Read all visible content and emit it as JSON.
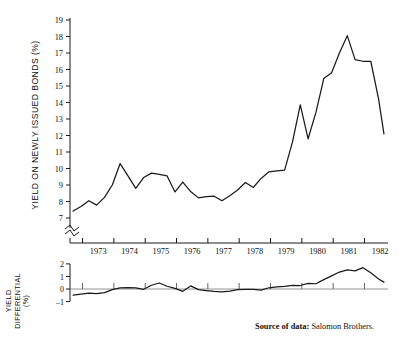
{
  "figure": {
    "source_label": "Source of data:",
    "source_value": "Salomon Brothers.",
    "background": "#ffffff",
    "line_color": "#1a1a1a",
    "axis_color": "#1a1a1a"
  },
  "main_axis": {
    "ylabel": "YIELD ON NEWLY ISSUED BONDS (%)",
    "yticks": [
      7,
      8,
      9,
      10,
      11,
      12,
      13,
      14,
      15,
      16,
      17,
      18,
      19
    ],
    "ytick_labels": [
      "7",
      "8",
      "9",
      "10",
      "11",
      "12",
      "13",
      "14",
      "15",
      "16",
      "17",
      "18",
      "19"
    ],
    "axis_break": true,
    "xtick_labels": [
      "1973",
      "1974",
      "1975",
      "1976",
      "1977",
      "1978",
      "1979",
      "1980",
      "1981",
      "1982"
    ]
  },
  "diff_axis": {
    "ylabel_line1": "YIELD",
    "ylabel_line2": "DIFFERENTIAL",
    "ylabel_unit": "(%)",
    "yticks": [
      -1,
      0,
      1,
      2
    ],
    "ytick_labels": [
      "-1",
      "0",
      "1",
      "2"
    ],
    "zero_line": 0
  },
  "chart_data": [
    {
      "type": "line",
      "title": "",
      "xlabel": "",
      "ylabel": "YIELD ON NEWLY ISSUED BONDS (%)",
      "ylim": [
        6.6,
        19.0
      ],
      "xlim": [
        1972.6,
        1982.75
      ],
      "grid": false,
      "legend": "none",
      "axis_break_below": 7,
      "xticks": [
        1973,
        1974,
        1975,
        1976,
        1977,
        1978,
        1979,
        1980,
        1981,
        1982
      ],
      "x": [
        1972.7,
        1972.95,
        1973.2,
        1973.45,
        1973.7,
        1973.95,
        1974.2,
        1974.45,
        1974.7,
        1974.95,
        1975.2,
        1975.45,
        1975.7,
        1975.95,
        1976.2,
        1976.45,
        1976.7,
        1976.95,
        1977.2,
        1977.45,
        1977.7,
        1977.95,
        1978.2,
        1978.45,
        1978.7,
        1978.95,
        1979.2,
        1979.45,
        1979.7,
        1979.95,
        1980.2,
        1980.45,
        1980.7,
        1980.95,
        1981.2,
        1981.45,
        1981.7,
        1981.95,
        1982.2,
        1982.45,
        1982.62
      ],
      "values": [
        7.42,
        7.7,
        8.05,
        7.78,
        8.25,
        9.0,
        10.3,
        9.55,
        8.8,
        9.45,
        9.72,
        9.65,
        9.55,
        8.58,
        9.18,
        8.6,
        8.22,
        8.3,
        8.32,
        8.05,
        8.35,
        8.7,
        9.15,
        8.85,
        9.4,
        9.8,
        9.85,
        9.9,
        11.6,
        13.85,
        11.8,
        13.4,
        15.45,
        15.8,
        17.0,
        18.05,
        16.6,
        16.5,
        16.5,
        14.2,
        12.1
      ],
      "ticklabel_positions": [
        1973,
        1974,
        1975,
        1976,
        1977,
        1978,
        1979,
        1980,
        1981,
        1982
      ]
    },
    {
      "type": "line",
      "title": "",
      "xlabel": "",
      "ylabel": "YIELD DIFFERENTIAL (%)",
      "ylim": [
        -1.35,
        2.15
      ],
      "xlim": [
        1972.6,
        1982.75
      ],
      "grid": false,
      "legend": "none",
      "yticks": [
        -1,
        0,
        1,
        2
      ],
      "zero_reference_line": 0,
      "x": [
        1972.7,
        1972.95,
        1973.2,
        1973.45,
        1973.7,
        1973.95,
        1974.2,
        1974.45,
        1974.7,
        1974.95,
        1975.2,
        1975.45,
        1975.7,
        1975.95,
        1976.2,
        1976.45,
        1976.7,
        1976.95,
        1977.2,
        1977.45,
        1977.7,
        1977.95,
        1978.2,
        1978.45,
        1978.7,
        1978.95,
        1979.2,
        1979.45,
        1979.7,
        1979.95,
        1980.2,
        1980.45,
        1980.7,
        1980.95,
        1981.2,
        1981.45,
        1981.7,
        1981.95,
        1982.2,
        1982.45,
        1982.62
      ],
      "values": [
        -0.48,
        -0.4,
        -0.32,
        -0.36,
        -0.28,
        -0.05,
        0.1,
        0.12,
        0.1,
        -0.02,
        0.3,
        0.48,
        0.22,
        0.05,
        -0.18,
        0.25,
        -0.05,
        -0.12,
        -0.18,
        -0.22,
        -0.16,
        -0.05,
        -0.03,
        -0.02,
        -0.08,
        0.1,
        0.18,
        0.22,
        0.3,
        0.28,
        0.45,
        0.42,
        0.75,
        1.05,
        1.35,
        1.52,
        1.45,
        1.7,
        1.3,
        0.8,
        0.55
      ]
    }
  ]
}
